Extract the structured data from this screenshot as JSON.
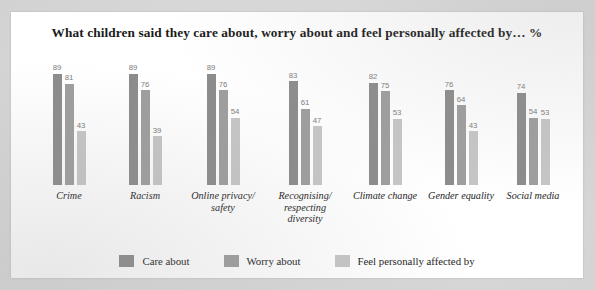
{
  "chart_data": {
    "type": "bar",
    "title": "What children said they care about, worry about and feel personally affected by…  %",
    "xlabel": "",
    "ylabel": "",
    "ylim": [
      0,
      100
    ],
    "grid": false,
    "legend_position": "bottom",
    "unit": "%",
    "categories": [
      "Crime",
      "Racism",
      "Online privacy/ safety",
      "Recognising/ respecting diversity",
      "Climate change",
      "Gender equality",
      "Social media"
    ],
    "category_lines": [
      [
        "Crime"
      ],
      [
        "Racism"
      ],
      [
        "Online privacy/",
        "safety"
      ],
      [
        "Recognising/",
        "respecting",
        "diversity"
      ],
      [
        "Climate change"
      ],
      [
        "Gender equality"
      ],
      [
        "Social media"
      ]
    ],
    "series": [
      {
        "name": "Care about",
        "color": "#8c8c8c",
        "values": [
          89,
          89,
          89,
          83,
          82,
          76,
          74
        ]
      },
      {
        "name": "Worry about",
        "color": "#9e9e9e",
        "values": [
          81,
          76,
          76,
          61,
          75,
          64,
          54
        ]
      },
      {
        "name": "Feel personally affected by",
        "color": "#c6c6c6",
        "values": [
          43,
          39,
          54,
          47,
          53,
          43,
          53
        ]
      }
    ]
  },
  "colors": {
    "page_background": "#d6d6d6",
    "card_background": "#ffffff",
    "title_text": "#1b1b1b",
    "value_label": "#7c7c7c",
    "category_label": "#242424",
    "series_1": "#8c8c8c",
    "series_2": "#9e9e9e",
    "series_3": "#c6c6c6"
  }
}
